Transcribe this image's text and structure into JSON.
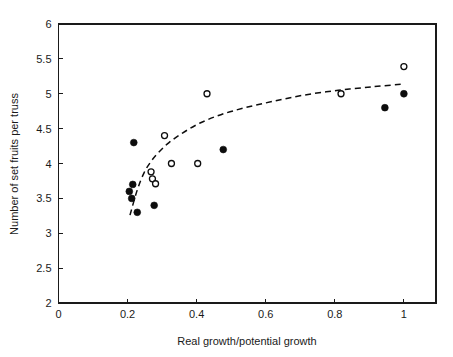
{
  "chart_data": {
    "type": "scatter",
    "title": "",
    "xlabel": "Real growth/potential growth",
    "ylabel": "Number of set fruits per truss",
    "xlim": [
      0,
      1.093
    ],
    "ylim": [
      2,
      6
    ],
    "xticks": [
      0,
      0.2,
      0.4,
      0.6,
      0.8,
      1
    ],
    "xtick_labels": [
      "0",
      "0.2",
      "0.4",
      "0.6",
      "0.8",
      "1"
    ],
    "yticks": [
      2,
      2.5,
      3,
      3.5,
      4,
      4.5,
      5,
      5.5,
      6
    ],
    "ytick_labels": [
      "2",
      "2.5",
      "3",
      "3.5",
      "4",
      "4.5",
      "5",
      "5.5",
      "6"
    ],
    "grid": false,
    "legend": "none",
    "series": [
      {
        "name": "filled-circles",
        "marker": "filled circle",
        "color": "#0d0d0d",
        "points": [
          [
            0.205,
            3.6
          ],
          [
            0.215,
            3.7
          ],
          [
            0.212,
            3.5
          ],
          [
            0.228,
            3.3
          ],
          [
            0.218,
            4.3
          ],
          [
            0.277,
            3.4
          ],
          [
            0.477,
            4.2
          ],
          [
            0.945,
            4.8
          ],
          [
            1.0,
            5.0
          ]
        ]
      },
      {
        "name": "open-circles",
        "marker": "open circle",
        "color": "#0d0d0d",
        "points": [
          [
            0.268,
            3.88
          ],
          [
            0.272,
            3.78
          ],
          [
            0.281,
            3.71
          ],
          [
            0.307,
            4.4
          ],
          [
            0.327,
            4.0
          ],
          [
            0.403,
            4.0
          ],
          [
            0.43,
            5.0
          ],
          [
            0.818,
            5.0
          ],
          [
            1.0,
            5.39
          ]
        ]
      }
    ],
    "fit_curve": {
      "name": "fitted-trend-line",
      "style": "dashed",
      "color": "#0d0d0d",
      "points": [
        [
          0.207,
          3.26
        ],
        [
          0.228,
          3.62
        ],
        [
          0.248,
          3.87
        ],
        [
          0.268,
          4.03
        ],
        [
          0.29,
          4.16
        ],
        [
          0.32,
          4.3
        ],
        [
          0.36,
          4.44
        ],
        [
          0.41,
          4.58
        ],
        [
          0.47,
          4.7
        ],
        [
          0.54,
          4.8
        ],
        [
          0.62,
          4.89
        ],
        [
          0.71,
          4.98
        ],
        [
          0.81,
          5.05
        ],
        [
          0.91,
          5.1
        ],
        [
          1.0,
          5.14
        ]
      ]
    }
  }
}
